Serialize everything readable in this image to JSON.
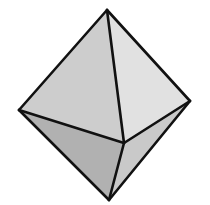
{
  "diagram": {
    "background": "#ffffff",
    "stroke_color": "#111111",
    "stroke_width": 2.6,
    "vertices": {
      "top": [
        107,
        10
      ],
      "left": [
        19,
        110
      ],
      "right": [
        190,
        101
      ],
      "front": [
        124,
        143
      ],
      "bottom": [
        109,
        200
      ]
    },
    "faces": [
      {
        "name": "upper-left-face",
        "points": "107,10 19,110 124,143",
        "fill": "#cdcdcd"
      },
      {
        "name": "upper-right-face",
        "points": "107,10 124,143 190,101",
        "fill": "#e1e1e1"
      },
      {
        "name": "lower-left-face",
        "points": "19,110 124,143 109,200",
        "fill": "#b1b1b1"
      },
      {
        "name": "lower-right-face",
        "points": "124,143 190,101 109,200",
        "fill": "#c9c9c9"
      }
    ],
    "edges": [
      {
        "name": "edge-top-left",
        "points": "107,10 19,110"
      },
      {
        "name": "edge-top-right",
        "points": "107,10 190,101"
      },
      {
        "name": "edge-top-front",
        "points": "107,10 124,143"
      },
      {
        "name": "edge-left-front",
        "points": "19,110 124,143"
      },
      {
        "name": "edge-right-front",
        "points": "190,101 124,143"
      },
      {
        "name": "edge-left-bottom",
        "points": "19,110 109,200"
      },
      {
        "name": "edge-right-bottom",
        "points": "190,101 109,200"
      },
      {
        "name": "edge-front-bottom",
        "points": "124,143 109,200"
      }
    ]
  }
}
